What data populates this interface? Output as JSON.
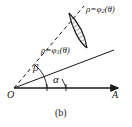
{
  "figure": {
    "caption": "(b)",
    "background_color": "#ffffff",
    "ink_color": "#1a1a1a",
    "labels": {
      "outer_curve": "ρ=φ2(θ)",
      "outer_curve_base": "ρ=φ",
      "outer_curve_sub": "2",
      "outer_curve_tail": "(θ)",
      "inner_curve": "ρ=φ1(θ)",
      "inner_curve_base": "ρ=φ",
      "inner_curve_sub": "1",
      "inner_curve_tail": "(θ)",
      "angle_upper": "β",
      "angle_lower": "α",
      "origin": "O",
      "axis_end": "A"
    },
    "geometry": {
      "origin_x": 14,
      "origin_y": 88,
      "axis_end_x": 122,
      "axis_end_y": 88,
      "ray_alpha_end_x": 112,
      "ray_alpha_end_y": 50,
      "ray_beta_end_x": 82,
      "ray_beta_end_y": 8,
      "ray_alpha_style": "solid",
      "ray_beta_style": "dashed",
      "region_fill": "hatched",
      "hatch_angle_deg": 60,
      "hatch_spacing_px": 4
    }
  }
}
